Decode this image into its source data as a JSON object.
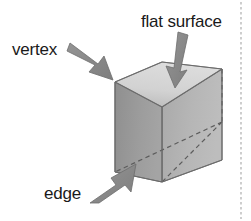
{
  "figure": {
    "kind": "geometry-diagram",
    "background_color": "#ffffff"
  },
  "labels": {
    "vertex": "vertex",
    "flat_surface": "flat surface",
    "edge": "edge"
  },
  "colors": {
    "front_face": "#9a9a9a",
    "top_face": "#cfcfcf",
    "right_face": "#b4b4b4",
    "outline": "#6f6f6f",
    "hidden_edge": "#5c5c5c",
    "arrow_fill": "#8a8a8a",
    "arrow_outline": "#6d6d6d",
    "text": "#1a1a1a",
    "margin_rule": "#b9b9b9"
  },
  "cube": {
    "front_face_points": "115,82 162,107 162,182 115,172",
    "top_face_points": "115,82 162,62 222,69 162,107",
    "right_face_points": "162,107 222,69 222,160 162,182",
    "hidden_vertex": "222,122",
    "hidden_edges": [
      "162,107 222,122",
      "222,122 222,160",
      "115,172 222,122",
      "162,182 222,122"
    ]
  },
  "annotations": [
    {
      "name": "vertex",
      "label": "vertex",
      "label_x": 12,
      "label_y": 55,
      "arrow_from": "72,47",
      "arrow_to": "116,82"
    },
    {
      "name": "flat-surface",
      "label": "flat surface",
      "label_x": 141,
      "label_y": 27,
      "arrow_from": "182,33",
      "arrow_to": "176,85"
    },
    {
      "name": "edge",
      "label": "edge",
      "label_x": 44,
      "label_y": 199,
      "arrow_from": "92,199",
      "arrow_to": "136,166"
    }
  ],
  "margin_rule": {
    "x": 241,
    "y_top": 2,
    "y_bottom": 219
  }
}
